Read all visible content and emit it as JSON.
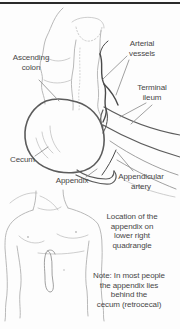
{
  "colors": {
    "page-bg": "#fdfdfd",
    "rule": "#2b2b2b",
    "ink-light": "#b9b9b9",
    "ink-medium": "#8f8f8f",
    "ink-dark": "#5c5c5c",
    "ink-vessel": "#4a4a4a",
    "text": "#474747"
  },
  "figure": {
    "anatomy": {
      "labels": {
        "ascending_colon": "Ascending\ncolon",
        "arterial_vessels": "Arterial\nvessels",
        "terminal_ileum": "Terminal\nileum",
        "cecum": "Cecum",
        "appendix": "Appendix",
        "appendicular_artery": "Appendicular\nartery"
      }
    },
    "torso": {
      "captions": {
        "location": "Location of the\nappendix on\nlower right\nquadrangle",
        "note": "Note: In most people\nthe appendix lies\nbehind the\ncecum (retrocecal)"
      }
    }
  }
}
